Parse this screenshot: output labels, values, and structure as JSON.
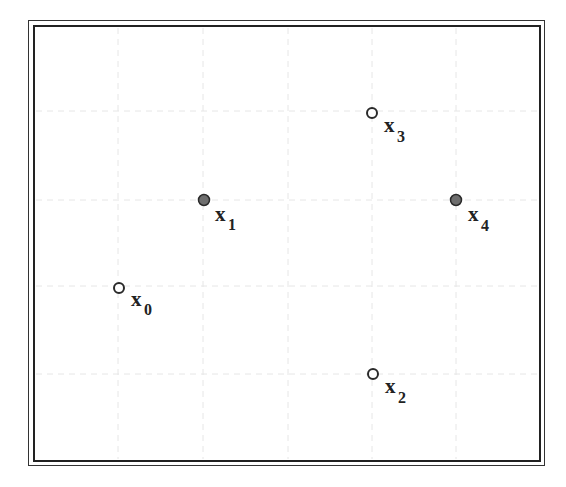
{
  "diagram": {
    "type": "point-lattice",
    "frame": {
      "style": "double-border",
      "outer_color": "#333333",
      "inner_color": "#222222"
    },
    "grid": {
      "visible": true,
      "style": "faint-dashed",
      "color": "#e6e6e6",
      "vertical_x": [
        118,
        203,
        288,
        372,
        456
      ],
      "horizontal_y": [
        111,
        200,
        286,
        374
      ]
    },
    "points": [
      {
        "id": "x0",
        "label": "x",
        "subscript": "0",
        "filled": false,
        "cx": 119,
        "cy": 288
      },
      {
        "id": "x1",
        "label": "x",
        "subscript": "1",
        "filled": true,
        "cx": 204,
        "cy": 200
      },
      {
        "id": "x2",
        "label": "x",
        "subscript": "2",
        "filled": false,
        "cx": 373,
        "cy": 374
      },
      {
        "id": "x3",
        "label": "x",
        "subscript": "3",
        "filled": false,
        "cx": 372,
        "cy": 113
      },
      {
        "id": "x4",
        "label": "x",
        "subscript": "4",
        "filled": true,
        "cx": 456,
        "cy": 200
      }
    ],
    "colors": {
      "filled_point": "#6e6e6e",
      "point_stroke": "#2a2a2a",
      "open_point_fill": "#ffffff",
      "label": "#222222"
    }
  }
}
